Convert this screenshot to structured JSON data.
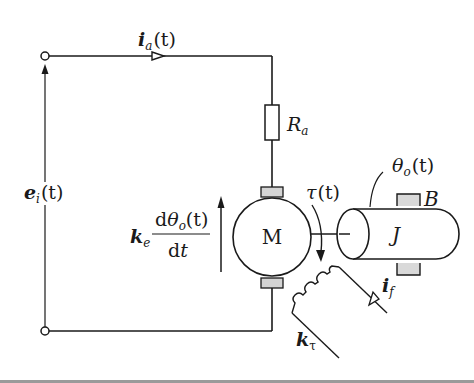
{
  "diagram": {
    "colors": {
      "line": "#1a1a1a",
      "brush_fill": "#d4d4d4",
      "bearing_fill": "#d9d9d9",
      "background": "#ffffff"
    },
    "labels": {
      "armature_current": {
        "base": "i",
        "sub": "a",
        "arg": "(t)"
      },
      "input_voltage": {
        "base": "e",
        "sub": "i",
        "arg": "(t)"
      },
      "armature_resistance": {
        "base": "R",
        "sub": "a"
      },
      "back_emf_gain": {
        "base": "k",
        "sub": "e"
      },
      "back_emf_numerator": {
        "prefix": "d",
        "base": "θ",
        "sub": "o",
        "arg": "(t)"
      },
      "back_emf_denominator": {
        "prefix": "d",
        "var": "t"
      },
      "motor": "M",
      "torque": {
        "base": "τ",
        "arg": "(t)"
      },
      "output_angle": {
        "base": "θ",
        "sub": "o",
        "arg": "(t)"
      },
      "inertia": "J",
      "friction": "B",
      "field_current": {
        "base": "i",
        "sub": "f"
      },
      "torque_constant": {
        "base": "k",
        "sub": "τ"
      }
    }
  }
}
